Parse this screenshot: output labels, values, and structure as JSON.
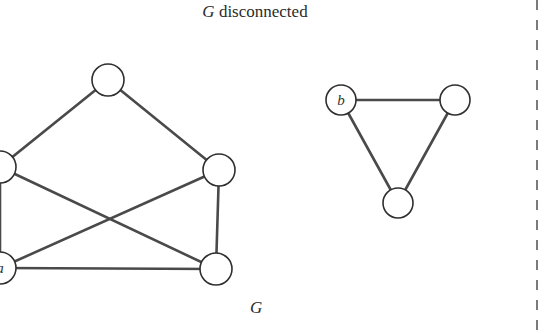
{
  "title": {
    "variable": "G",
    "text": "disconnected"
  },
  "caption": "G",
  "colors": {
    "edge": "#4a4a4a",
    "node_stroke": "#2f2f2f",
    "node_fill": "#ffffff",
    "text": "#2b2b2b"
  },
  "graph": {
    "components": [
      {
        "name": "pentagon-component",
        "nodes": [
          {
            "id": "top",
            "x": 108,
            "y": 80,
            "r": 16,
            "label": ""
          },
          {
            "id": "left",
            "x": 0,
            "y": 167,
            "r": 16,
            "label": ""
          },
          {
            "id": "right",
            "x": 219,
            "y": 170,
            "r": 16,
            "label": ""
          },
          {
            "id": "a",
            "x": 0,
            "y": 268,
            "r": 16,
            "label": "a"
          },
          {
            "id": "bottom-right",
            "x": 216,
            "y": 269,
            "r": 16,
            "label": ""
          }
        ],
        "edges": [
          [
            "top",
            "left"
          ],
          [
            "top",
            "right"
          ],
          [
            "left",
            "a"
          ],
          [
            "left",
            "bottom-right"
          ],
          [
            "right",
            "a"
          ],
          [
            "right",
            "bottom-right"
          ],
          [
            "a",
            "bottom-right"
          ]
        ]
      },
      {
        "name": "triangle-component",
        "nodes": [
          {
            "id": "b",
            "x": 341,
            "y": 100,
            "r": 15,
            "label": "b"
          },
          {
            "id": "tri-right",
            "x": 455,
            "y": 100,
            "r": 15,
            "label": ""
          },
          {
            "id": "tri-bottom",
            "x": 398,
            "y": 203,
            "r": 15,
            "label": ""
          }
        ],
        "edges": [
          [
            "b",
            "tri-right"
          ],
          [
            "b",
            "tri-bottom"
          ],
          [
            "tri-right",
            "tri-bottom"
          ]
        ]
      }
    ]
  },
  "divider": {
    "x": 537,
    "style": "dashed"
  }
}
